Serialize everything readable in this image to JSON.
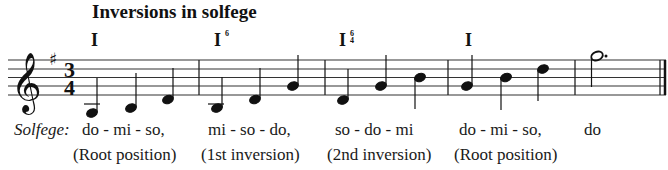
{
  "title": "Inversions in solfege",
  "key_signature": "G major (1 sharp)",
  "time_signature": {
    "top": "3",
    "bottom": "4"
  },
  "chords": [
    {
      "symbol": "I",
      "figure_top": "",
      "figure_bottom": ""
    },
    {
      "symbol": "I",
      "figure_top": "6",
      "figure_bottom": ""
    },
    {
      "symbol": "I",
      "figure_top": "6",
      "figure_bottom": "4"
    },
    {
      "symbol": "I",
      "figure_top": "",
      "figure_bottom": ""
    }
  ],
  "measures": [
    {
      "notes": [
        "G3",
        "B3",
        "D4"
      ],
      "duration": "quarter"
    },
    {
      "notes": [
        "B3",
        "D4",
        "G4"
      ],
      "duration": "quarter"
    },
    {
      "notes": [
        "D4",
        "G4",
        "B4"
      ],
      "duration": "quarter"
    },
    {
      "notes": [
        "G4",
        "B4",
        "D5"
      ],
      "duration": "quarter"
    },
    {
      "notes": [
        "G5"
      ],
      "duration": "dotted half"
    }
  ],
  "lyrics": {
    "label": "Solfege:",
    "syllables": [
      "do - mi - so,",
      "mi - so - do,",
      "so - do - mi",
      "do - mi - so,",
      "do"
    ],
    "positions": [
      "(Root position)",
      "(1st inversion)",
      "(2nd inversion)",
      "(Root position)"
    ]
  },
  "colors": {
    "ink": "#111111",
    "staff": "#333333",
    "background": "#ffffff"
  }
}
